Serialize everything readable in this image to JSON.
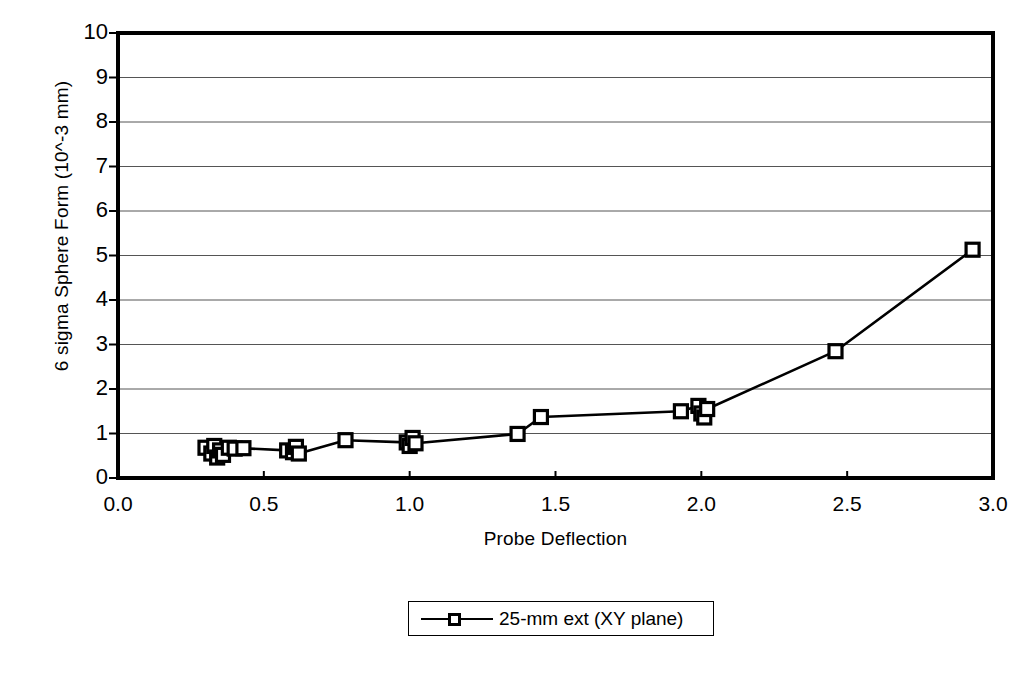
{
  "chart_data": {
    "type": "line",
    "title": "",
    "xlabel": "Probe Deflection",
    "ylabel": "6 sigma Sphere Form (10^-3 mm)",
    "xlim": [
      0.0,
      3.0
    ],
    "ylim": [
      0,
      10
    ],
    "xticks": [
      "0.0",
      "0.5",
      "1.0",
      "1.5",
      "2.0",
      "2.5",
      "3.0"
    ],
    "xtick_values": [
      0.0,
      0.5,
      1.0,
      1.5,
      2.0,
      2.5,
      3.0
    ],
    "yticks": [
      "0",
      "1",
      "2",
      "3",
      "4",
      "5",
      "6",
      "7",
      "8",
      "9",
      "10"
    ],
    "ytick_values": [
      0,
      1,
      2,
      3,
      4,
      5,
      6,
      7,
      8,
      9,
      10
    ],
    "grid": "horizontal",
    "legend_position": "bottom-center",
    "marker": "open-square",
    "line_color": "#000000",
    "marker_color": "#000000",
    "series": [
      {
        "name": "25-mm ext (XY plane)",
        "points": [
          {
            "x": 0.3,
            "y": 0.68
          },
          {
            "x": 0.32,
            "y": 0.55
          },
          {
            "x": 0.33,
            "y": 0.72
          },
          {
            "x": 0.34,
            "y": 0.46
          },
          {
            "x": 0.35,
            "y": 0.62
          },
          {
            "x": 0.36,
            "y": 0.52
          },
          {
            "x": 0.38,
            "y": 0.68
          },
          {
            "x": 0.4,
            "y": 0.66
          },
          {
            "x": 0.43,
            "y": 0.67
          },
          {
            "x": 0.58,
            "y": 0.62
          },
          {
            "x": 0.6,
            "y": 0.58
          },
          {
            "x": 0.61,
            "y": 0.7
          },
          {
            "x": 0.62,
            "y": 0.55
          },
          {
            "x": 0.78,
            "y": 0.85
          },
          {
            "x": 0.99,
            "y": 0.8
          },
          {
            "x": 1.0,
            "y": 0.72
          },
          {
            "x": 1.01,
            "y": 0.9
          },
          {
            "x": 1.02,
            "y": 0.78
          },
          {
            "x": 1.37,
            "y": 0.99
          },
          {
            "x": 1.45,
            "y": 1.37
          },
          {
            "x": 1.93,
            "y": 1.5
          },
          {
            "x": 1.99,
            "y": 1.62
          },
          {
            "x": 2.0,
            "y": 1.45
          },
          {
            "x": 2.01,
            "y": 1.36
          },
          {
            "x": 2.02,
            "y": 1.55
          },
          {
            "x": 2.46,
            "y": 2.85
          },
          {
            "x": 2.93,
            "y": 5.13
          }
        ]
      }
    ]
  },
  "legend": {
    "entries": [
      {
        "label": "25-mm ext (XY plane)"
      }
    ]
  }
}
